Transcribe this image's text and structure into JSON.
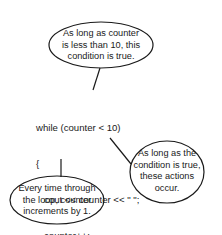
{
  "diagram": {
    "type": "annotated-code",
    "code": {
      "lines": [
        "while (counter < 10)",
        "{",
        "   cout << counter << \" \";",
        "   counter++;",
        "}"
      ]
    },
    "callouts": [
      {
        "id": "condition",
        "lines": [
          "As long as counter",
          "is less than 10, this",
          "condition is true."
        ],
        "points_to": "while (counter < 10)"
      },
      {
        "id": "actions",
        "lines": [
          "As long as the",
          "condition is true,",
          "these actions",
          "occur."
        ],
        "points_to": "loop body"
      },
      {
        "id": "increment",
        "lines": [
          "Every time through",
          "the loop, counter",
          "increments by 1."
        ],
        "points_to": "closing brace / counter++"
      }
    ],
    "colors": {
      "stroke": "#1a1a1a",
      "text": "#1a1a1a",
      "background": "#ffffff"
    }
  }
}
